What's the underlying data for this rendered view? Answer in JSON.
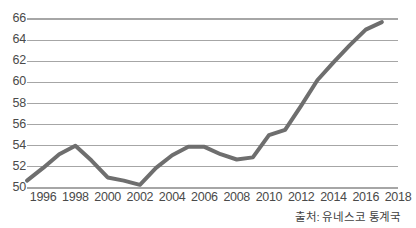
{
  "chart_data": {
    "type": "line",
    "title": "",
    "xlabel": "",
    "ylabel": "",
    "xlim": [
      1995,
      2018
    ],
    "ylim": [
      50,
      66
    ],
    "grid": true,
    "legend": null,
    "x_ticks": [
      "1996",
      "1998",
      "2000",
      "2002",
      "2004",
      "2006",
      "2008",
      "2010",
      "2012",
      "2014",
      "2016",
      "2018"
    ],
    "y_ticks": [
      "50",
      "52",
      "54",
      "56",
      "58",
      "60",
      "62",
      "64",
      "66"
    ],
    "x": [
      1995,
      1996,
      1997,
      1998,
      1999,
      2000,
      2001,
      2002,
      2003,
      2004,
      2005,
      2006,
      2007,
      2008,
      2009,
      2010,
      2011,
      2012,
      2013,
      2014,
      2015,
      2016,
      2017
    ],
    "series": [
      {
        "name": "value",
        "color": "#6e6e6e",
        "values": [
          50.7,
          51.9,
          53.2,
          54.0,
          52.6,
          51.0,
          50.7,
          50.3,
          51.9,
          53.1,
          53.9,
          53.9,
          53.2,
          52.7,
          52.9,
          55.0,
          55.5,
          57.8,
          60.2,
          61.9,
          63.5,
          65.0,
          65.7
        ]
      }
    ],
    "annotations": {
      "source": "출처: 유네스코 통계국"
    },
    "style": {
      "background": "#ffffff",
      "grid_color": "#a6a6a6",
      "axis_color": "#a6a6a6",
      "tick_text_color": "#4a4a4a",
      "line_width": 4
    }
  },
  "axis": {
    "y_labels": [
      "66",
      "64",
      "62",
      "60",
      "58",
      "56",
      "54",
      "52",
      "50"
    ],
    "x_labels": [
      "1996",
      "1998",
      "2000",
      "2002",
      "2004",
      "2006",
      "2008",
      "2010",
      "2012",
      "2014",
      "2016",
      "2018"
    ]
  },
  "footer": {
    "source_text": "출처: 유네스코 통계국"
  }
}
